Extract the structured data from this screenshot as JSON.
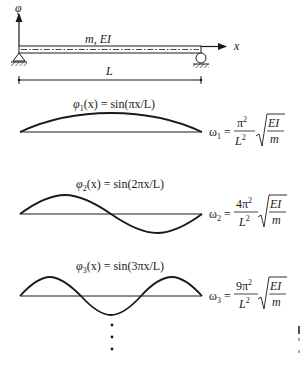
{
  "diagram": {
    "beam": {
      "axis_vertical_label": "φ",
      "axis_horizontal_label": "x",
      "properties_label": "m, EI",
      "length_label": "L",
      "left_support": "pin",
      "right_support": "roller"
    },
    "modes": [
      {
        "index": 1,
        "shape_label": "φ₁(x) = sin(πx/L)",
        "shape_fn_prefix": "φ",
        "shape_sub": "1",
        "shape_fn_rest": "(x) = sin(πx/L)",
        "freq_lhs": "ω",
        "freq_sub": "1",
        "freq_numerator": "π",
        "freq_numerator_exp": "2",
        "freq_denominator": "L",
        "freq_denominator_exp": "2",
        "sqrt_numerator": "EI",
        "sqrt_denominator": "m",
        "half_waves": 1
      },
      {
        "index": 2,
        "shape_label": "φ₂(x) = sin(2πx/L)",
        "shape_fn_prefix": "φ",
        "shape_sub": "2",
        "shape_fn_rest": "(x) = sin(2πx/L)",
        "freq_lhs": "ω",
        "freq_sub": "2",
        "freq_numerator": "4π",
        "freq_numerator_exp": "2",
        "freq_denominator": "L",
        "freq_denominator_exp": "2",
        "sqrt_numerator": "EI",
        "sqrt_denominator": "m",
        "half_waves": 2
      },
      {
        "index": 3,
        "shape_label": "φ₃(x) = sin(3πx/L)",
        "shape_fn_prefix": "φ",
        "shape_sub": "3",
        "shape_fn_rest": "(x) = sin(3πx/L)",
        "freq_lhs": "ω",
        "freq_sub": "3",
        "freq_numerator": "9π",
        "freq_numerator_exp": "2",
        "freq_denominator": "L",
        "freq_denominator_exp": "2",
        "sqrt_numerator": "EI",
        "sqrt_denominator": "m",
        "half_waves": 3
      }
    ],
    "continuation": "⋮",
    "colors": {
      "ink": "#1a1a1a",
      "background": "#ffffff"
    }
  }
}
